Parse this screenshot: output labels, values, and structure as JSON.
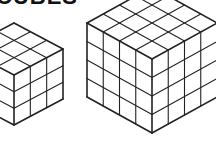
{
  "heading": {
    "text": "CUBES"
  },
  "colors": {
    "stroke": "#222222",
    "background": "#ffffff"
  },
  "figures": [
    {
      "name": "small-cube",
      "grid": 3,
      "front_top": [
        14,
        75
      ],
      "half_width": 49,
      "half_height": 26,
      "side_height": 50
    },
    {
      "name": "large-cube",
      "grid": 4,
      "front_top": [
        152,
        59
      ],
      "half_width": 65,
      "half_height": 36,
      "side_height": 74
    }
  ]
}
